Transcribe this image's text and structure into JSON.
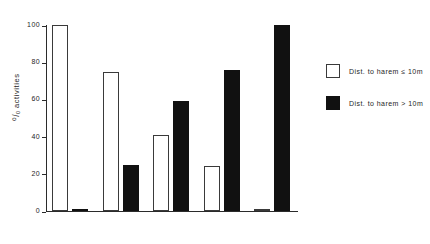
{
  "chart_data": {
    "type": "bar",
    "title": "",
    "xlabel": "",
    "ylabel": "% activities",
    "ylabel_prefix": "⁰/₀",
    "ylabel_text": "activities",
    "ylim": [
      0,
      100
    ],
    "yticks": [
      0,
      20,
      40,
      60,
      80,
      100
    ],
    "ytick_labels": [
      "0",
      "20",
      "40",
      "60",
      "80",
      "100"
    ],
    "grid": false,
    "categories": [
      "Lies",
      "Urinates",
      "Thrashes",
      "Wipes face",
      "Wallows"
    ],
    "category_label_position": "top",
    "series": [
      {
        "name": "Dist. to harem ≤ 10m",
        "style": "open",
        "color": "#ffffff",
        "edge_color": "#3a3a3a",
        "values": [
          100,
          75,
          41,
          24,
          1
        ]
      },
      {
        "name": "Dist. to harem > 10m",
        "style": "filled",
        "color": "#111111",
        "edge_color": "#111111",
        "values": [
          1,
          25,
          59,
          76,
          100
        ]
      }
    ],
    "legend": {
      "position": "right",
      "entries": [
        {
          "label": "Dist. to harem ≤ 10m",
          "style": "open"
        },
        {
          "label": "Dist. to harem > 10m",
          "style": "filled"
        }
      ]
    }
  }
}
